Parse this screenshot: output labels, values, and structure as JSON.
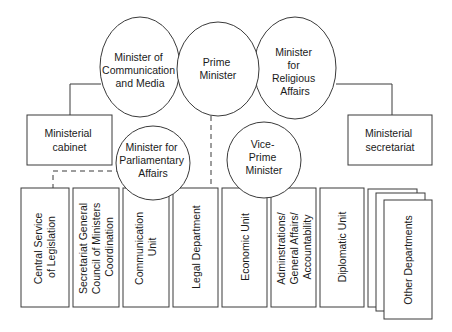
{
  "diagram": {
    "type": "org-chart",
    "top_circles": [
      {
        "id": "minister-communication-media",
        "lines": [
          "Minister of",
          "Communication",
          "and Media"
        ]
      },
      {
        "id": "prime-minister",
        "lines": [
          "Prime",
          "Minister"
        ]
      },
      {
        "id": "minister-religious-affairs",
        "lines": [
          "Minister",
          "for",
          "Religious",
          "Affairs"
        ]
      }
    ],
    "mid_boxes": [
      {
        "id": "ministerial-cabinet",
        "lines": [
          "Ministerial",
          "cabinet"
        ]
      },
      {
        "id": "ministerial-secretariat",
        "lines": [
          "Ministerial",
          "secretariat"
        ]
      }
    ],
    "mid_circles": [
      {
        "id": "minister-parliamentary-affairs",
        "lines": [
          "Minister for",
          "Parliamentary",
          "Affairs"
        ]
      },
      {
        "id": "vice-prime-minister",
        "lines": [
          "Vice-",
          "Prime",
          "Minister"
        ]
      }
    ],
    "departments": [
      {
        "id": "central-service-legislation",
        "lines": [
          "Central Service",
          "of Legislation"
        ]
      },
      {
        "id": "secretariat-general-council",
        "lines": [
          "Secretariat General",
          "Council of Ministers",
          "Coordination"
        ]
      },
      {
        "id": "communication-unit",
        "lines": [
          "Communication",
          "Unit"
        ]
      },
      {
        "id": "legal-department",
        "lines": [
          "Legal Department"
        ]
      },
      {
        "id": "economic-unit",
        "lines": [
          "Economic Unit"
        ]
      },
      {
        "id": "administrations-general-affairs",
        "lines": [
          "Adminstrations/",
          "General Affairs/",
          "Accountability"
        ]
      },
      {
        "id": "diplomatic-unit",
        "lines": [
          "Diplomatic Unit"
        ]
      },
      {
        "id": "other-departments",
        "lines": [
          "Other Departments"
        ]
      }
    ],
    "connections": [
      {
        "from": "minister-communication-media",
        "to": "ministerial-cabinet",
        "style": "solid"
      },
      {
        "from": "minister-religious-affairs",
        "to": "ministerial-secretariat",
        "style": "solid"
      },
      {
        "from": "prime-minister",
        "to": "departments",
        "style": "dashed"
      },
      {
        "from": "minister-parliamentary-affairs",
        "to": "central-service-legislation",
        "style": "dashed"
      }
    ],
    "colors": {
      "stroke": "#3a3a3a",
      "fill": "#ffffff",
      "text": "#1a1a1a"
    }
  }
}
